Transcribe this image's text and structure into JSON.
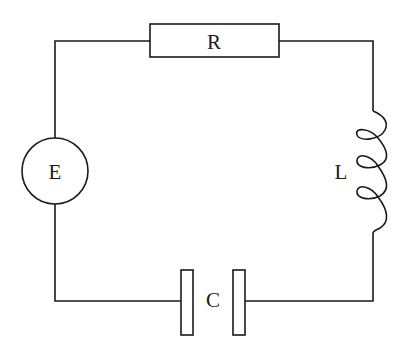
{
  "diagram": {
    "type": "series RLC circuit",
    "stroke_color": "#1a1a1a",
    "background": "#ffffff",
    "components": [
      {
        "id": "E",
        "label": "E",
        "kind": "voltage-source",
        "position": "left"
      },
      {
        "id": "R",
        "label": "R",
        "kind": "resistor",
        "position": "top"
      },
      {
        "id": "L",
        "label": "L",
        "kind": "inductor",
        "position": "right"
      },
      {
        "id": "C",
        "label": "C",
        "kind": "capacitor",
        "position": "bottom"
      }
    ],
    "labels": {
      "E": "E",
      "R": "R",
      "L": "L",
      "C": "C"
    }
  }
}
